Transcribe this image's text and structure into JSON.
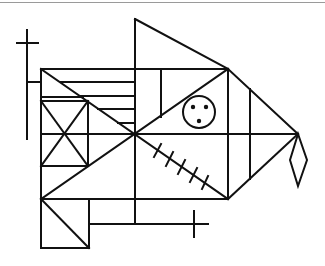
{
  "figure": {
    "name": "Rey-Osterrieth complex figure",
    "stroke_color": "#111111",
    "background": "#ffffff",
    "top_rule_color": "#9a9a9a"
  },
  "elements": {
    "main_rectangle": {
      "x1": 41,
      "y1": 69,
      "x2": 228,
      "y2": 199
    },
    "apex_triangle": {
      "apex": [
        135,
        19
      ],
      "base_top": [
        228,
        69
      ]
    },
    "right_triangle_tip": [
      298,
      134
    ],
    "diamond": {
      "top": [
        298,
        134
      ],
      "left": [
        290,
        160
      ],
      "bottom": [
        298,
        186
      ],
      "right": [
        307,
        160
      ]
    },
    "circle_with_dots": {
      "cx": 199,
      "cy": 112,
      "r": 16,
      "dots": 3
    },
    "hatch_marks": 5,
    "horizontal_parallel_lines": 4,
    "top_left_cross": {
      "vertical_x": 27,
      "horizontal_y": 43
    },
    "bottom_right_cross": {
      "vertical_x": 194,
      "horizontal_y": 224
    }
  }
}
